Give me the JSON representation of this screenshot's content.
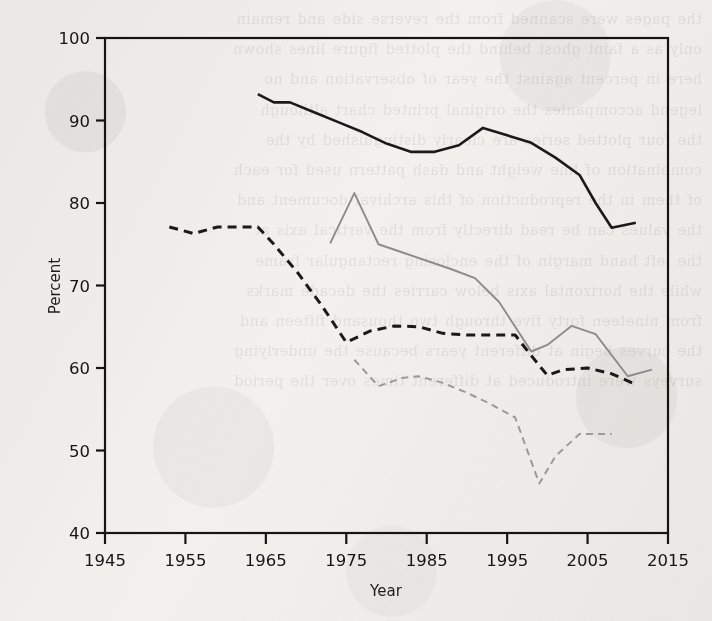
{
  "figure": {
    "background_color": "#f4f3f1",
    "paper_texture": true,
    "width": 712,
    "height": 621
  },
  "bleed_through_text": "the pages were scanned from the reverse side and remain\nonly as a faint ghost behind the plotted figure lines shown\nhere in percent against the year of observation and no\nlegend accompanies the original printed chart although\nthe four plotted series are clearly distinguished by the\ncombination of line weight and dash pattern used for each\nof them in the reproduction of this archival document and\nthe values can be read directly from the vertical axis at\nthe left hand margin of the enclosing rectangular frame\nwhile the horizontal axis below carries the decade marks\nfrom nineteen forty five through two thousand fifteen and\nthe curves begin at different years because the underlying\nsurveys were introduced at different times over the period",
  "chart_data": {
    "type": "line",
    "title": "",
    "xlabel": "Year",
    "ylabel": "Percent",
    "xlim": [
      1945,
      2015
    ],
    "ylim": [
      40,
      100
    ],
    "xticks": [
      1945,
      1955,
      1965,
      1975,
      1985,
      1995,
      2005,
      2015
    ],
    "yticks": [
      40,
      50,
      60,
      70,
      80,
      90,
      100
    ],
    "grid": false,
    "legend": "none",
    "frame": "full-box",
    "series": [
      {
        "name": "series-solid-black",
        "color": "#1a1a1a",
        "style": "solid",
        "width": 2.6,
        "x": [
          1964,
          1966,
          1968,
          1971,
          1974,
          1977,
          1980,
          1983,
          1986,
          1989,
          1992,
          1995,
          1998,
          2001,
          2004,
          2006,
          2008,
          2011
        ],
        "y": [
          93.2,
          92.2,
          92.2,
          91.0,
          89.8,
          88.6,
          87.2,
          86.2,
          86.2,
          87.0,
          89.1,
          88.2,
          87.3,
          85.5,
          83.4,
          80.0,
          77.0,
          77.6
        ]
      },
      {
        "name": "series-dashed-black",
        "color": "#1a1a1a",
        "style": "dashed",
        "width": 3.0,
        "x": [
          1953,
          1956,
          1959,
          1962,
          1964,
          1966,
          1969,
          1972,
          1975,
          1978,
          1981,
          1984,
          1987,
          1990,
          1993,
          1996,
          1998,
          2000,
          2002,
          2005,
          2008,
          2011
        ],
        "y": [
          77.1,
          76.3,
          77.1,
          77.1,
          77.1,
          75.0,
          71.5,
          67.5,
          63.1,
          64.5,
          65.1,
          65.0,
          64.2,
          64.0,
          64.0,
          64.0,
          61.5,
          59.1,
          59.8,
          60.0,
          59.3,
          58.0
        ]
      },
      {
        "name": "series-solid-gray",
        "color": "#8c8c8c",
        "style": "solid",
        "width": 1.9,
        "x": [
          1973,
          1976,
          1979,
          1982,
          1985,
          1988,
          1991,
          1994,
          1996,
          1998,
          2000,
          2003,
          2006,
          2010,
          2013
        ],
        "y": [
          75.1,
          81.2,
          75.0,
          74.0,
          73.0,
          72.0,
          70.9,
          68.0,
          65.0,
          62.0,
          62.8,
          65.1,
          64.1,
          59.0,
          59.8
        ]
      },
      {
        "name": "series-dashed-gray",
        "color": "#9a9a9a",
        "style": "dashed",
        "width": 2.0,
        "x": [
          1976,
          1979,
          1982,
          1984,
          1987,
          1990,
          1993,
          1996,
          1999,
          2001,
          2004,
          2006,
          2008
        ],
        "y": [
          61.0,
          57.8,
          58.8,
          59.0,
          58.2,
          57.0,
          55.6,
          54.0,
          46.0,
          49.3,
          52.0,
          52.0,
          52.0
        ]
      }
    ]
  },
  "axes": {
    "x_axis_title": "Year",
    "y_axis_title": "Percent",
    "x_tick_labels": [
      "1945",
      "1955",
      "1965",
      "1975",
      "1985",
      "1995",
      "2005",
      "2015"
    ],
    "y_tick_labels": [
      "40",
      "50",
      "60",
      "70",
      "80",
      "90",
      "100"
    ]
  }
}
